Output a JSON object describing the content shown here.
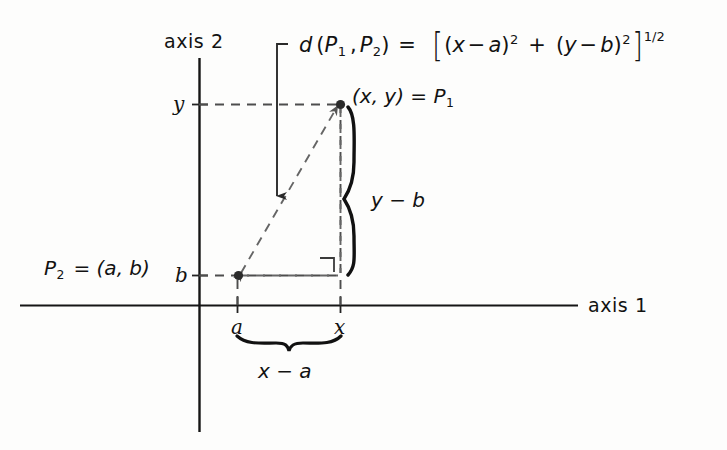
{
  "figure": {
    "axes": {
      "vertical_label": "axis",
      "vertical_number": "2",
      "horizontal_label": "axis",
      "horizontal_number": "1"
    },
    "ticks": {
      "y_label": "y",
      "b_label": "b",
      "a_label": "a",
      "x_label": "x"
    },
    "labels": {
      "point1_text": "(x, y)  =  P",
      "point1_sub": "1",
      "point2_lead": "P",
      "point2_sub": "2",
      "point2_rest": "=  (a, b)",
      "vertical_leg": "y − b",
      "horizontal_leg": "x − a"
    },
    "formula": {
      "d": "d",
      "open_paren": "(",
      "p1": "P",
      "p1_sub": "1",
      "comma": ",",
      "p2": "P",
      "p2_sub": "2",
      "close_paren": ")",
      "equals": "=",
      "lbracket": "[",
      "term1_open": "(",
      "term1_x": "x",
      "term1_minus": "−",
      "term1_a": "a",
      "term1_close": ")",
      "term1_exp": "2",
      "plus": "+",
      "term2_open": "(",
      "term2_y": "y",
      "term2_minus": "−",
      "term2_b": "b",
      "term2_close": ")",
      "term2_exp": "2",
      "rbracket": "]",
      "outer_exp": "1/2",
      "plain": "d (P1 , P2) = [(x−a)2 + (y−b)2]1/2"
    },
    "colors": {
      "ink": "#121212",
      "dashed": "#5a5a5a",
      "background": "#fdfdfc"
    }
  }
}
